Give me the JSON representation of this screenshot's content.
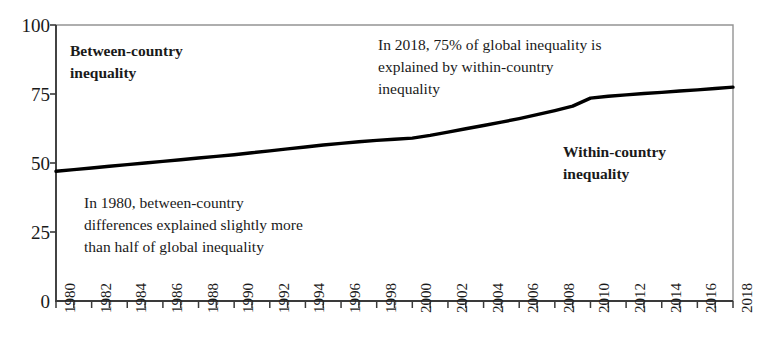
{
  "chart_data": {
    "type": "line",
    "title": "",
    "subtitle": "",
    "xlabel": "",
    "ylabel": "",
    "xlim": [
      1980,
      2018
    ],
    "ylim": [
      0,
      100
    ],
    "grid": false,
    "legend_position": "none",
    "line_color": "#000000",
    "axis_color": "#3a3a3a",
    "yticks": [
      "0",
      "25",
      "50",
      "75",
      "100"
    ],
    "ytick_values": [
      0,
      25,
      50,
      75,
      100
    ],
    "xticks": [
      "1980",
      "1982",
      "1984",
      "1986",
      "1988",
      "1990",
      "1992",
      "1994",
      "1996",
      "1998",
      "2000",
      "2002",
      "2004",
      "2006",
      "2008",
      "2010",
      "2012",
      "2014",
      "2016",
      "2018"
    ],
    "xtick_values": [
      1980,
      1982,
      1984,
      1986,
      1988,
      1990,
      1992,
      1994,
      1996,
      1998,
      2000,
      2002,
      2004,
      2006,
      2008,
      2010,
      2012,
      2014,
      2016,
      2018
    ],
    "minor_tick_interval": 1,
    "series": [
      {
        "name": "Within-country share of global inequality",
        "x": [
          1980,
          1981,
          1982,
          1983,
          1984,
          1985,
          1986,
          1987,
          1988,
          1989,
          1990,
          1991,
          1992,
          1993,
          1994,
          1995,
          1996,
          1997,
          1998,
          1999,
          2000,
          2001,
          2002,
          2003,
          2004,
          2005,
          2006,
          2007,
          2008,
          2009,
          2010,
          2011,
          2012,
          2013,
          2014,
          2015,
          2016,
          2017,
          2018
        ],
        "values": [
          47.0,
          47.6,
          48.2,
          48.8,
          49.4,
          50.0,
          50.6,
          51.2,
          51.8,
          52.4,
          53.0,
          53.7,
          54.4,
          55.1,
          55.8,
          56.5,
          57.1,
          57.7,
          58.2,
          58.6,
          59.0,
          60.0,
          61.2,
          62.4,
          63.6,
          64.8,
          66.1,
          67.5,
          69.0,
          70.6,
          73.5,
          74.2,
          74.7,
          75.2,
          75.6,
          76.1,
          76.5,
          77.0,
          77.5
        ]
      }
    ],
    "annotations": [
      {
        "name": "between-country-label",
        "text": "Between-country\ninequality",
        "bold": true,
        "x_px": 70,
        "y_px": 40
      },
      {
        "name": "within-country-label",
        "text": "Within-country\ninequality",
        "bold": true,
        "x_px": 563,
        "y_px": 141
      },
      {
        "name": "annotation-2018",
        "text": "In 2018, 75% of global inequality is\nexplained by within-country\ninequality",
        "bold": false,
        "x_px": 378,
        "y_px": 34
      },
      {
        "name": "annotation-1980",
        "text": "In 1980, between-country\ndifferences explained slightly more\nthan half of global inequality",
        "bold": false,
        "x_px": 84,
        "y_px": 192
      }
    ]
  }
}
